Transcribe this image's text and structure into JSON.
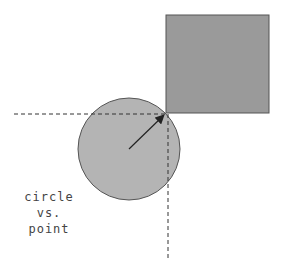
{
  "diagram": {
    "caption_lines": [
      "circle",
      "vs.",
      "point"
    ],
    "colors": {
      "square_fill": "#9a9a9a",
      "square_stroke": "#555555",
      "circle_fill": "#b4b4b4",
      "circle_stroke": "#555555",
      "line": "#333333",
      "text": "#444444"
    },
    "square": {
      "x": 166,
      "y": 15,
      "w": 103,
      "h": 98
    },
    "circle": {
      "cx": 129,
      "cy": 149,
      "r": 51
    },
    "point": {
      "x": 166,
      "y": 113
    },
    "arrow": {
      "x1": 129,
      "y1": 149,
      "x2": 164,
      "y2": 115
    }
  }
}
